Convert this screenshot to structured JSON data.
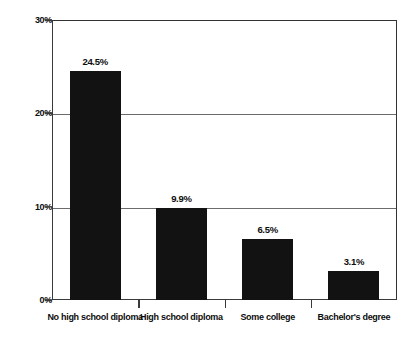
{
  "chart_data": {
    "type": "bar",
    "title": "",
    "subtitle": "",
    "xlabel": "",
    "ylabel": "",
    "categories": [
      "No high school diploma",
      "High school diploma",
      "Some college",
      "Bachelor's degree"
    ],
    "values": [
      24.5,
      9.9,
      6.5,
      3.1
    ],
    "value_labels": [
      "24.5%",
      "9.9%",
      "6.5%",
      "3.1%"
    ],
    "ylim": [
      0,
      30
    ],
    "yticks": [
      0,
      10,
      20,
      30
    ],
    "ytick_labels": [
      "0%",
      "10%",
      "20%",
      "30%"
    ],
    "grid": true,
    "grid_axis": "y",
    "legend": false,
    "legend_position": "none",
    "bar_color": "#121212",
    "grid_color": "#6b6b6b",
    "axis_color": "#3a3a3a",
    "background_color": "#ffffff",
    "text_color": "#0d0d0d"
  }
}
